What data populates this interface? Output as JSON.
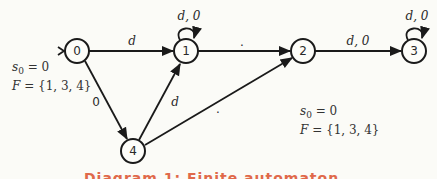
{
  "diagram": {
    "type": "finite-state-machine",
    "nodes": [
      {
        "id": "0",
        "label": "0",
        "x": 77,
        "y": 51
      },
      {
        "id": "1",
        "label": "1",
        "x": 186,
        "y": 51
      },
      {
        "id": "2",
        "label": "2",
        "x": 303,
        "y": 51
      },
      {
        "id": "3",
        "label": "3",
        "x": 414,
        "y": 51
      },
      {
        "id": "4",
        "label": "4",
        "x": 133,
        "y": 151
      }
    ],
    "edges": [
      {
        "from": "0",
        "to": "1",
        "label": "d"
      },
      {
        "from": "1",
        "to": "1",
        "label": "d, 0"
      },
      {
        "from": "1",
        "to": "2",
        "label": "."
      },
      {
        "from": "2",
        "to": "3",
        "label": "d, 0"
      },
      {
        "from": "3",
        "to": "3",
        "label": "d, 0"
      },
      {
        "from": "0",
        "to": "4",
        "label": "0"
      },
      {
        "from": "4",
        "to": "1",
        "label": "d"
      },
      {
        "from": "4",
        "to": "2",
        "label": "."
      }
    ],
    "start_state": "0"
  },
  "info_left": {
    "s0": "s",
    "s0_sub": "0",
    "s0_value": " = 0",
    "F": "F",
    "F_value": " = {1, 3, 4}"
  },
  "info_right": {
    "s0": "s",
    "s0_sub": "0",
    "s0_value": " = 0",
    "F": "F",
    "F_value": " = {1, 3, 4}"
  },
  "caption": "Diagram 1: Finite automaton"
}
